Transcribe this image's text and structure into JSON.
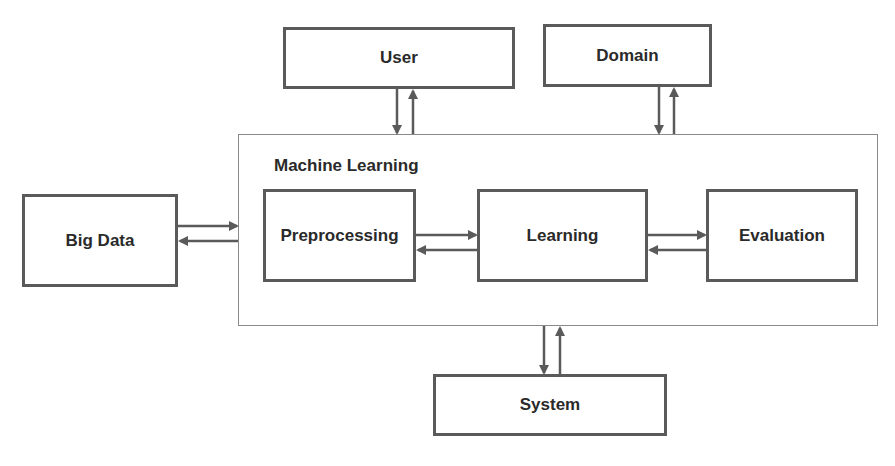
{
  "diagram": {
    "container": {
      "label": "Machine Learning"
    },
    "nodes": {
      "user": "User",
      "domain": "Domain",
      "big_data": "Big Data",
      "preprocessing": "Preprocessing",
      "learning": "Learning",
      "evaluation": "Evaluation",
      "system": "System"
    },
    "edges": [
      {
        "from": "Machine Learning",
        "to": "User",
        "bidirectional": true
      },
      {
        "from": "Machine Learning",
        "to": "Domain",
        "bidirectional": true
      },
      {
        "from": "Big Data",
        "to": "Machine Learning",
        "bidirectional": true
      },
      {
        "from": "Preprocessing",
        "to": "Learning",
        "bidirectional": true
      },
      {
        "from": "Learning",
        "to": "Evaluation",
        "bidirectional": true
      },
      {
        "from": "Machine Learning",
        "to": "System",
        "bidirectional": true
      }
    ],
    "colors": {
      "border": "#5a5a5a",
      "arrow": "#5a5a5a",
      "text": "#2a2a2a"
    }
  }
}
